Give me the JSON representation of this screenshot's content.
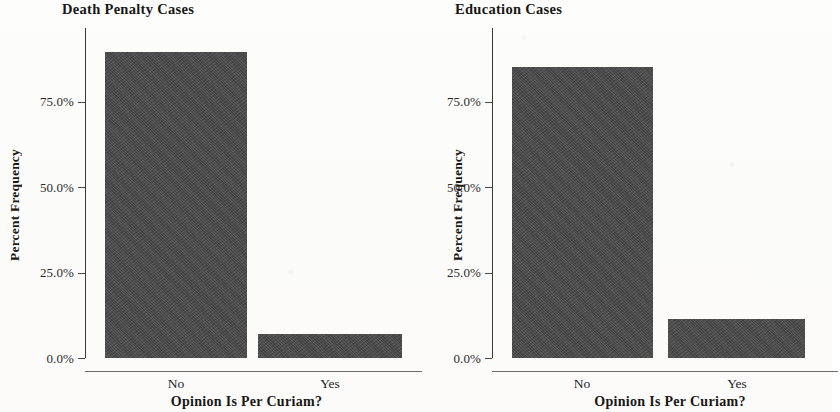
{
  "figure": {
    "background_color": "#fbfbfa",
    "bar_color": "#4a4a4a",
    "axis_color": "#3b3a38"
  },
  "chart_data": [
    {
      "type": "bar",
      "title": "Death Penalty Cases",
      "xlabel": "Opinion Is Per Curiam?",
      "ylabel": "Percent Frequency",
      "categories": [
        "No",
        "Yes"
      ],
      "values": [
        92.7,
        7.3
      ],
      "ylim": [
        0,
        100
      ],
      "ytick_values": [
        0,
        25,
        50,
        75
      ],
      "ytick_labels": [
        "0.0%",
        "25.0%",
        "50.0%",
        "75.0%"
      ],
      "grid": false,
      "legend": false
    },
    {
      "type": "bar",
      "title": "Education Cases",
      "xlabel": "Opinion Is Per Curiam?",
      "ylabel": "Percent Frequency",
      "categories": [
        "No",
        "Yes"
      ],
      "values": [
        88.2,
        11.8
      ],
      "ylim": [
        0,
        100
      ],
      "ytick_values": [
        0,
        25,
        50,
        75
      ],
      "ytick_labels": [
        "0.0%",
        "25.0%",
        "50.0%",
        "75.0%"
      ],
      "grid": false,
      "legend": false
    }
  ]
}
